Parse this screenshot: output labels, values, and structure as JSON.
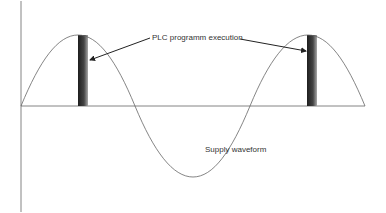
{
  "diagram": {
    "title": "",
    "labels": {
      "plc_execution": "PLC programm execution",
      "supply_waveform": "Supply waveform"
    },
    "elements": {
      "waveform": "sine wave, 1.5 cycles",
      "execution_bars": 2
    },
    "colors": {
      "line": "#555555",
      "bar_dark": "#222222",
      "bar_light": "#9a9a9a"
    }
  }
}
